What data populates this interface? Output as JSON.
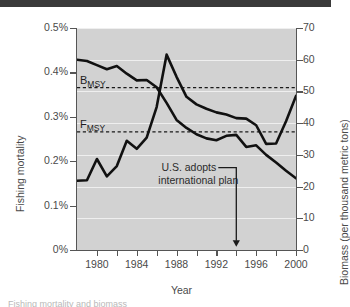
{
  "figure": {
    "top_bar": true,
    "caption_partial": "Fishing mortality and biomass"
  },
  "chart_data": {
    "type": "line",
    "title": "",
    "xlabel": "Year",
    "ylabel": "Fishing mortality",
    "ylabel_right": "Biomass (per thousand metric tons)",
    "xlim": [
      1978,
      2000
    ],
    "ylim": [
      0,
      0.005
    ],
    "ylim_right": [
      0,
      70
    ],
    "grid": true,
    "legend": "none",
    "xticks": [
      1980,
      1984,
      1988,
      1992,
      1996,
      2000
    ],
    "xticklabels": [
      "1980",
      "1984",
      "1988",
      "1992",
      "1996",
      "2000"
    ],
    "xminor_step": 2,
    "yticks_left": [
      0,
      0.001,
      0.002,
      0.003,
      0.004,
      0.005
    ],
    "yticklabels_left": [
      "0%",
      "0.1%",
      "0.2%",
      "0.3%",
      "0.4%",
      "0.5%"
    ],
    "yticks_right": [
      0,
      10,
      20,
      30,
      40,
      50,
      60,
      70
    ],
    "yticklabels_right": [
      "0",
      "10",
      "20",
      "30",
      "40",
      "50",
      "60",
      "70"
    ],
    "series": [
      {
        "name": "Fishing mortality",
        "axis": "left",
        "units": "percent",
        "color": "#111111",
        "x": [
          1978,
          1979,
          1980,
          1981,
          1982,
          1983,
          1984,
          1985,
          1986,
          1987,
          1988,
          1989,
          1990,
          1991,
          1992,
          1993,
          1994,
          1995,
          1996,
          1997,
          1998,
          1999,
          2000
        ],
        "values": [
          0.00156,
          0.00157,
          0.00205,
          0.00166,
          0.00189,
          0.00246,
          0.00228,
          0.00253,
          0.00322,
          0.0044,
          0.0039,
          0.00345,
          0.00328,
          0.00318,
          0.0031,
          0.00305,
          0.00297,
          0.00296,
          0.00281,
          0.00239,
          0.0024,
          0.0029,
          0.00347
        ]
      },
      {
        "name": "Biomass",
        "axis": "right",
        "units": "thousand metric tons",
        "color": "#111111",
        "x": [
          1978,
          1979,
          1980,
          1981,
          1982,
          1983,
          1984,
          1985,
          1986,
          1987,
          1988,
          1989,
          1990,
          1991,
          1992,
          1993,
          1994,
          1995,
          1996,
          1997,
          1998,
          1999,
          2000
        ],
        "values": [
          60.0,
          59.6,
          58.3,
          57.0,
          58.0,
          55.6,
          53.5,
          53.6,
          51.3,
          46.4,
          41.0,
          38.5,
          36.5,
          35.2,
          34.6,
          36.0,
          36.3,
          32.5,
          33.0,
          30.0,
          27.6,
          25.0,
          22.6
        ]
      }
    ],
    "reference_lines": [
      {
        "label": "B",
        "sublabel": "MSY",
        "axis": "right",
        "value": 51.2,
        "style": "dashed"
      },
      {
        "label": "F",
        "sublabel": "MSY",
        "axis": "left",
        "value": 0.00266,
        "style": "dashed"
      }
    ],
    "annotations": [
      {
        "name": "us-adopts-plan",
        "line1": "U.S. adopts",
        "line2": "international plan",
        "arrow_x": 1994,
        "arrow_to_y_frac": 0.985
      }
    ]
  }
}
